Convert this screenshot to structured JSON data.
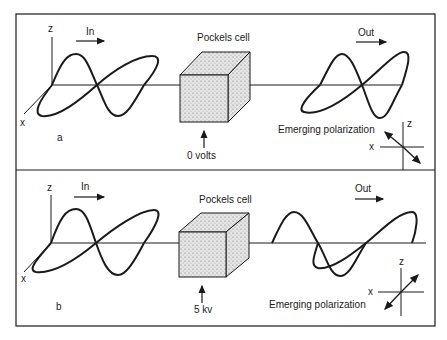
{
  "figure": {
    "panel_a": {
      "label": "a",
      "in_label": "In",
      "out_label": "Out",
      "cell_label": "Pockels cell",
      "voltage_label": "0 volts",
      "polarization_label": "Emerging polarization",
      "axis_z": "z",
      "axis_x": "x",
      "polarization_direction": "diagonal (upper-left to lower-right)"
    },
    "panel_b": {
      "label": "b",
      "in_label": "In",
      "out_label": "Out",
      "cell_label": "Pockels cell",
      "voltage_label": "5 kv",
      "polarization_label": "Emerging polarization",
      "axis_z": "z",
      "axis_x": "x",
      "polarization_direction": "diagonal (lower-left to upper-right)"
    }
  }
}
